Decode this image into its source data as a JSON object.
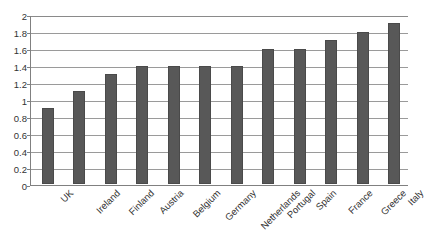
{
  "chart_data": {
    "type": "bar",
    "title": "",
    "subtitle": "",
    "xlabel": "",
    "ylabel": "",
    "ylim": [
      0,
      2
    ],
    "yticks": [
      "0",
      "0.2",
      "0.4",
      "0.6",
      "0.8",
      "1",
      "1.2",
      "1.4",
      "1.6",
      "1.8",
      "2"
    ],
    "ytick_values": [
      0,
      0.2,
      0.4,
      0.6,
      0.8,
      1,
      1.2,
      1.4,
      1.6,
      1.8,
      2
    ],
    "grid": "horizontal",
    "legend": "none",
    "categories": [
      "UK",
      "Ireland",
      "Finland",
      "Austria",
      "Belgium",
      "Germany",
      "Netherlands",
      "Portugal",
      "Spain",
      "France",
      "Greece",
      "Italy"
    ],
    "values": [
      0.9,
      1.1,
      1.3,
      1.4,
      1.4,
      1.4,
      1.4,
      1.6,
      1.6,
      1.7,
      1.8,
      1.9
    ],
    "series": [
      {
        "name": "",
        "values": [
          0.9,
          1.1,
          1.3,
          1.4,
          1.4,
          1.4,
          1.4,
          1.6,
          1.6,
          1.7,
          1.8,
          1.9
        ]
      }
    ],
    "colors": {
      "bar_fill": "#585858",
      "bar_edge": "#4a4a4a",
      "gridline": "#9a9a9a",
      "axis": "#808080",
      "background": "#ffffff",
      "text": "#333333"
    }
  }
}
